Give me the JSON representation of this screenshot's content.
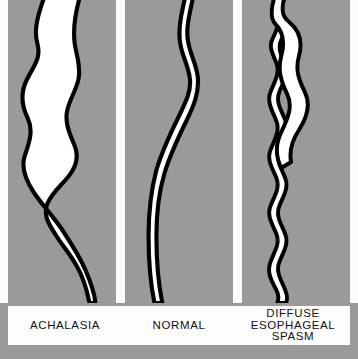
{
  "figure": {
    "title_text_present": false,
    "background_color": "#9a9a9a",
    "panel_background_color": "#9a9a9a",
    "band_background_color": "#fdfdfd",
    "lumen_fill_color": "#ffffff",
    "outline_color": "#000000",
    "caption_text_color": "#111111"
  },
  "panels": [
    {
      "id": "achalasia",
      "shape_name": "dilated-esophagus-with-birds-beak-taper",
      "caption_lines": [
        "ACHALASIA"
      ]
    },
    {
      "id": "normal",
      "shape_name": "uniform-caliber-smooth-esophagus",
      "caption_lines": [
        "NORMAL"
      ]
    },
    {
      "id": "diffuse-esophageal-spasm",
      "shape_name": "corkscrew-serrated-esophagus",
      "caption_lines": [
        "DIFFUSE",
        "ESOPHAGEAL",
        "SPASM"
      ]
    }
  ]
}
